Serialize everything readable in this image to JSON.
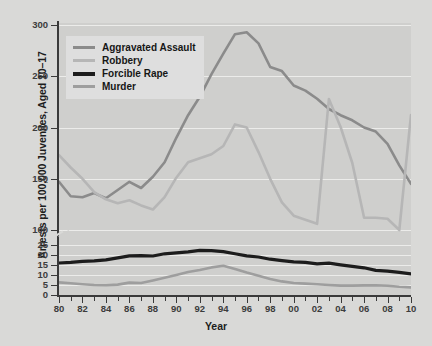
{
  "axes": {
    "ytitle": "Arrests per 100,000 Juveniles, Aged 10–17",
    "xtitle": "Year",
    "ylabels": [
      "300",
      "250",
      "200",
      "150",
      "100",
      "25",
      "20",
      "15",
      "10",
      "5",
      "0"
    ],
    "xlabels": [
      "80",
      "82",
      "84",
      "86",
      "88",
      "90",
      "92",
      "94",
      "96",
      "98",
      "00",
      "02",
      "04",
      "06",
      "08",
      "10"
    ]
  },
  "legend": {
    "items": [
      {
        "label": "Aggravated Assault",
        "color": "#8b8b8b"
      },
      {
        "label": "Robbery",
        "color": "#b6b6b6"
      },
      {
        "label": "Forcible Rape",
        "color": "#1c1c1c"
      },
      {
        "label": "Murder",
        "color": "#9e9e9e"
      }
    ]
  },
  "chart_data": {
    "type": "line",
    "title": "",
    "xlabel": "Year",
    "ylabel": "Arrests per 100,000 Juveniles, Aged 10–17",
    "grid": true,
    "legend_position": "top-left",
    "note": "Broken y-axis: lower band 0-25 expanded, upper band 100-300 compressed",
    "ylim_lower": [
      0,
      25
    ],
    "ylim_upper": [
      100,
      300
    ],
    "x": [
      1980,
      1981,
      1982,
      1983,
      1984,
      1985,
      1986,
      1987,
      1988,
      1989,
      1990,
      1991,
      1992,
      1993,
      1994,
      1995,
      1996,
      1997,
      1998,
      1999,
      2000,
      2001,
      2002,
      2003,
      2004,
      2005,
      2006,
      2007,
      2008,
      2009,
      2010
    ],
    "xtick_labels": [
      "80",
      "81",
      "82",
      "83",
      "84",
      "85",
      "86",
      "87",
      "88",
      "89",
      "90",
      "91",
      "92",
      "93",
      "94",
      "95",
      "96",
      "97",
      "98",
      "99",
      "00",
      "01",
      "02",
      "03",
      "04",
      "05",
      "06",
      "07",
      "08",
      "09",
      "10"
    ],
    "series": [
      {
        "name": "Aggravated Assault",
        "color": "#8b8b8b",
        "values": [
          147,
          133,
          132,
          136,
          131,
          139,
          147,
          141,
          152,
          166,
          190,
          212,
          230,
          252,
          272,
          291,
          293,
          282,
          259,
          255,
          241,
          236,
          228,
          218,
          212,
          207,
          200,
          196,
          184,
          163,
          145
        ]
      },
      {
        "name": "Robbery",
        "color": "#b6b6b6",
        "values": [
          173,
          161,
          150,
          137,
          130,
          126,
          129,
          124,
          120,
          132,
          151,
          166,
          170,
          174,
          182,
          203,
          200,
          176,
          150,
          127,
          114,
          110,
          106,
          98,
          84,
          66,
          112,
          112,
          111,
          100,
          90
        ]
      },
      {
        "name": "Forcible Rape",
        "color": "#1c1c1c",
        "values": [
          16.0,
          16.3,
          16.8,
          17.1,
          17.6,
          18.6,
          19.6,
          19.7,
          19.5,
          20.6,
          21.1,
          21.6,
          22.3,
          22.2,
          21.7,
          20.6,
          19.6,
          19.0,
          17.9,
          17.2,
          16.6,
          16.3,
          15.6,
          15.9,
          15.1,
          14.3,
          13.6,
          12.3,
          11.9,
          11.3,
          10.6
        ]
      },
      {
        "name": "Murder",
        "color": "#9e9e9e",
        "values": [
          6.3,
          5.9,
          5.4,
          5.0,
          4.9,
          5.2,
          6.2,
          6.0,
          7.3,
          8.6,
          10.0,
          11.5,
          12.5,
          13.8,
          14.6,
          13.0,
          11.2,
          9.6,
          8.0,
          6.8,
          6.0,
          5.7,
          5.4,
          5.0,
          4.7,
          4.7,
          4.8,
          4.9,
          4.6,
          4.1,
          3.8
        ]
      }
    ]
  }
}
